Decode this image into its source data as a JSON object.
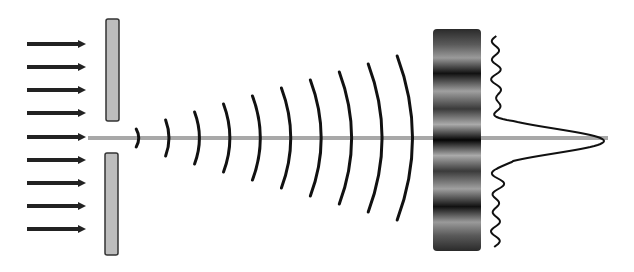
{
  "diagram": {
    "colors": {
      "background": "#ffffff",
      "arrow": "#222222",
      "barrier_fill": "#bdbdbd",
      "barrier_stroke": "#333333",
      "axis": "#a8a8a8",
      "wavefront": "#111111",
      "intensity_curve": "#111111"
    },
    "incident_arrows": {
      "count": 9,
      "y_positions": [
        44,
        67,
        90,
        113,
        137,
        160,
        183,
        206,
        229
      ],
      "x_start": 27,
      "x_end": 86
    },
    "slit": {
      "upper_barrier": {
        "x": 106,
        "y": 19,
        "w": 13,
        "h": 102
      },
      "lower_barrier": {
        "x": 105,
        "y": 153,
        "w": 13,
        "h": 102
      }
    },
    "axis": {
      "y": 138,
      "x_start": 88,
      "x_end": 608
    },
    "wavefronts": [
      {
        "x": 138,
        "half_height": 9
      },
      {
        "x": 168,
        "half_height": 18
      },
      {
        "x": 198,
        "half_height": 26
      },
      {
        "x": 228,
        "half_height": 34
      },
      {
        "x": 258,
        "half_height": 42
      },
      {
        "x": 288,
        "half_height": 50
      },
      {
        "x": 318,
        "half_height": 58
      },
      {
        "x": 348,
        "half_height": 66
      },
      {
        "x": 378,
        "half_height": 74
      },
      {
        "x": 408,
        "half_height": 82
      }
    ],
    "screen": {
      "x": 433,
      "y": 29,
      "w": 48,
      "h": 222,
      "fringe_pattern": "alternating dark/light bands, darkest at center"
    },
    "intensity_profile": {
      "peak_x": 604,
      "baseline_x": 495,
      "center_y": 141
    }
  }
}
